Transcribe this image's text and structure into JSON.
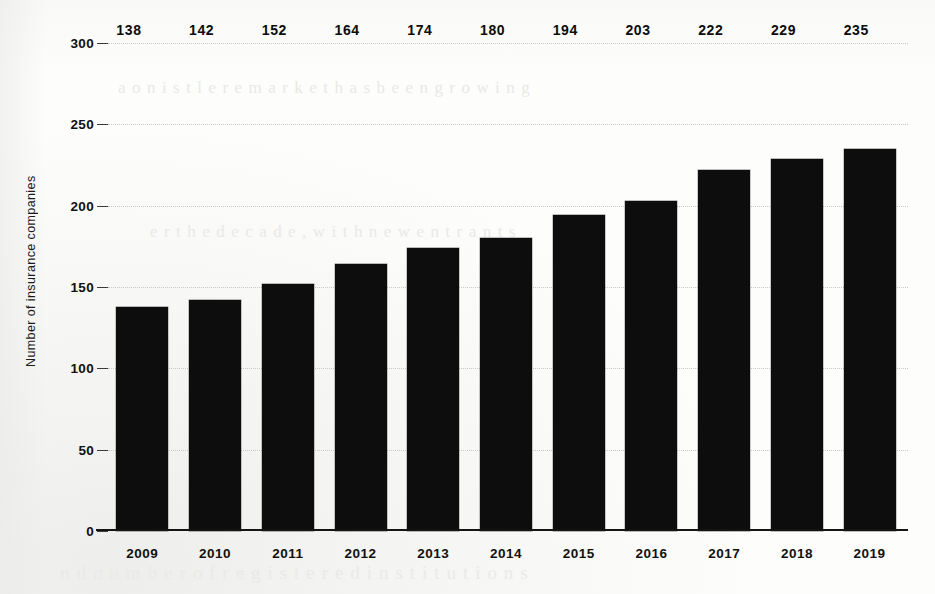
{
  "chart_data": {
    "type": "bar",
    "title": "",
    "xlabel": "",
    "ylabel": "Number of insurance companies",
    "categories": [
      "2009",
      "2010",
      "2011",
      "2012",
      "2013",
      "2014",
      "2015",
      "2016",
      "2017",
      "2018",
      "2019"
    ],
    "values": [
      138,
      142,
      152,
      164,
      174,
      180,
      194,
      203,
      222,
      229,
      235
    ],
    "data_labels": [
      "138",
      "142",
      "152",
      "164",
      "174",
      "180",
      "194",
      "203",
      "222",
      "229",
      "235"
    ],
    "ylim": [
      0,
      300
    ],
    "ytick_labels": [
      "0",
      "50",
      "100",
      "150",
      "200",
      "250",
      "300"
    ],
    "ytick_values": [
      0,
      50,
      100,
      150,
      200,
      250,
      300
    ],
    "grid": true,
    "grid_axis": "y",
    "legend": null,
    "bar_color": "#0d0d0d",
    "grid_color": "#c9c9c6",
    "axis_color": "#141414",
    "background_color": "#fdfdfc"
  },
  "scan_artifacts": {
    "ghost_text": [
      "a  o  n   i s t  l e   r  e   m  a r k  e t   h a s   b e e n   g r o w i n g",
      "e  r  t h e   d e c a d e  ,   w i t h   n e w   e n t r a n t s",
      "n d   n u m b e r   o f   r e g i s t e r e d   i n s t i t u t i o n s"
    ]
  }
}
